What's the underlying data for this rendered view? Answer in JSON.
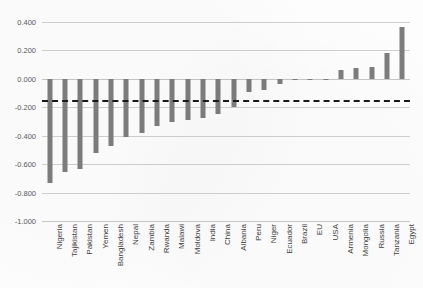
{
  "chart_data": {
    "type": "bar",
    "title": "",
    "subtitle": "",
    "xlabel": "",
    "ylabel": "",
    "ylim": [
      -1.0,
      0.4
    ],
    "grid": true,
    "legend": false,
    "ytick_labels": [
      "0.400",
      "0.200",
      "0.000",
      "-0.200",
      "-0.400",
      "-0.600",
      "-0.800",
      "-1.000"
    ],
    "ytick_values": [
      0.4,
      0.2,
      0.0,
      -0.2,
      -0.4,
      -0.6,
      -0.8,
      -1.0
    ],
    "bar_color": "#7d7d7d",
    "threshold_line": {
      "value": -0.15,
      "style": "dashed",
      "color": "#1a1a1a"
    },
    "categories": [
      "Nigeria",
      "Tajikistan",
      "Pakistan",
      "Yemen",
      "Bangladesh",
      "Nepal",
      "Zambia",
      "Rwanda",
      "Malawi",
      "Moldova",
      "India",
      "China",
      "Albania",
      "Peru",
      "Niger",
      "Ecuador",
      "Brazil",
      "EU",
      "USA",
      "Armenia",
      "Mongolia",
      "Russia",
      "Tanzania",
      "Egypt"
    ],
    "values": [
      -0.73,
      -0.655,
      -0.635,
      -0.52,
      -0.475,
      -0.41,
      -0.38,
      -0.33,
      -0.305,
      -0.29,
      -0.275,
      -0.25,
      -0.2,
      -0.09,
      -0.08,
      -0.035,
      -0.002,
      -0.002,
      -0.002,
      0.06,
      0.075,
      0.085,
      0.185,
      0.365
    ]
  }
}
